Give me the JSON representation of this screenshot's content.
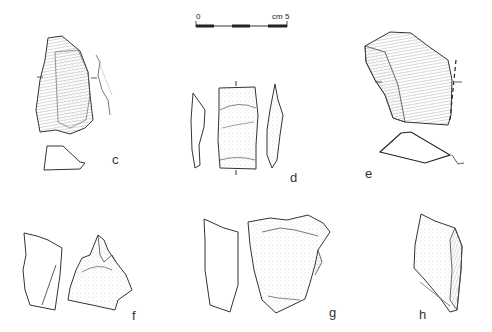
{
  "figure": {
    "scale_bar": {
      "start_label": "0",
      "end_label": "cm 5"
    },
    "artifacts": [
      {
        "id": "c",
        "label": "c"
      },
      {
        "id": "d",
        "label": "d"
      },
      {
        "id": "e",
        "label": "e"
      },
      {
        "id": "f",
        "label": "f"
      },
      {
        "id": "g",
        "label": "g"
      },
      {
        "id": "h",
        "label": "h"
      }
    ]
  }
}
